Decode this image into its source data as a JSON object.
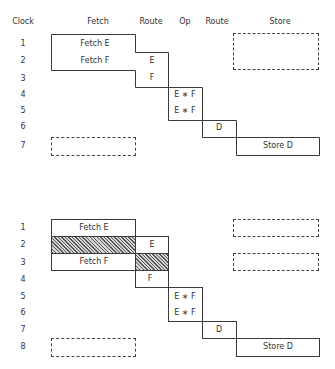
{
  "columns": [
    "Clock",
    "Fetch",
    "Route",
    "Op",
    "Route",
    "Store"
  ],
  "top": {
    "clock_labels": [
      "1",
      "2",
      "3",
      "4",
      "5",
      "6",
      "7"
    ],
    "fetch_cells": [
      "Fetch E",
      "Fetch F"
    ],
    "route1_cells": [
      "E",
      "F"
    ],
    "op_cells": [
      "E ∗ F",
      "E ∗ F"
    ],
    "route2_cells": [
      "D"
    ],
    "store_cells": [
      "Store D"
    ]
  },
  "bottom": {
    "clock_labels": [
      "1",
      "2",
      "3",
      "4",
      "5",
      "6",
      "7",
      "8"
    ],
    "fetch_cells": [
      "Fetch E",
      "Fetch F"
    ],
    "route1_cells": [
      "E",
      "F"
    ],
    "op_cells": [
      "E ∗ F",
      "E ∗ F"
    ],
    "route2_cells": [
      "D"
    ],
    "store_cells": [
      "Store D"
    ]
  }
}
